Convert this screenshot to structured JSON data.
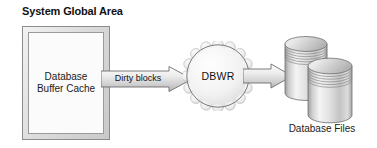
{
  "diagram": {
    "title": "System Global Area",
    "sga": {
      "box_label_line1": "Database",
      "box_label_line2": "Buffer Cache"
    },
    "flow": {
      "dirty_arrow_label": "Dirty blocks",
      "process_label": "DBWR"
    },
    "storage": {
      "files_label": "Database Files"
    },
    "colors": {
      "background": "#ffffff",
      "frame_border": "#8c8c8c",
      "frame_fill_light": "#f2f2f2",
      "frame_fill_dark": "#c9c9c9",
      "inner_fill": "#fbfbfb",
      "arrow_fill_light": "#f4f4f4",
      "arrow_fill_dark": "#bdbdbd",
      "arrow_stroke": "#6e6e6e",
      "gear_fill": "#ededed",
      "gear_stroke": "#a8a8a8",
      "circle_stroke": "#6d6d6d",
      "cylinder_light": "#fafafa",
      "cylinder_dark": "#b0b0b0",
      "cylinder_stroke": "#707070",
      "text": "#111111"
    }
  }
}
